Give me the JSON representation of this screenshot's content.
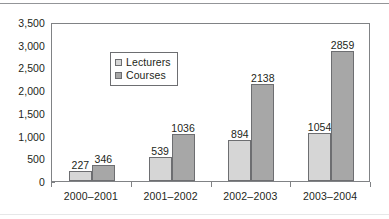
{
  "chart_data": {
    "type": "bar",
    "title": "",
    "subtitle": "",
    "xlabel": "",
    "ylabel": "",
    "categories": [
      "2000–2001",
      "2001–2002",
      "2002–2003",
      "2003–2004"
    ],
    "series": [
      {
        "name": "Lecturers",
        "color": "#d6d6d6",
        "values": [
          227,
          539,
          894,
          1054
        ],
        "labels": [
          "227",
          "539",
          "894",
          "1054"
        ]
      },
      {
        "name": "Courses",
        "color": "#a7a7a7",
        "values": [
          346,
          1036,
          2138,
          2859
        ],
        "labels": [
          "346",
          "1036",
          "2138",
          "2859"
        ]
      }
    ],
    "ylim": [
      0,
      3500
    ],
    "ytick_values": [
      0,
      500,
      1000,
      1500,
      2000,
      2500,
      3000,
      3500
    ],
    "ytick_labels": [
      "0",
      "500",
      "1,000",
      "1,500",
      "2,000",
      "2,500",
      "3,000",
      "3,500"
    ],
    "grid": false,
    "legend_position": "top-left",
    "legend_entries": [
      "Lecturers",
      "Courses"
    ],
    "show_data_labels": true
  }
}
